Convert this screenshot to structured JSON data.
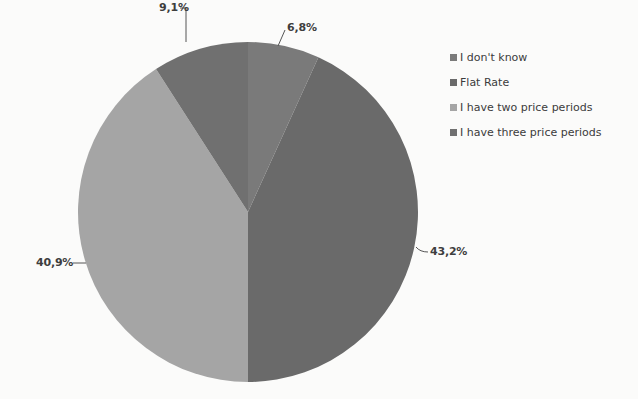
{
  "chart_data": {
    "type": "pie",
    "title": "",
    "categories": [
      "I don't know",
      "Flat Rate",
      "I have two price periods",
      "I have three price periods"
    ],
    "values": [
      6.8,
      43.2,
      40.9,
      9.1
    ],
    "value_labels": [
      "6,8%",
      "43,2%",
      "40,9%",
      "9,1%"
    ],
    "colors": [
      "#7a7a7a",
      "#6a6a6a",
      "#a5a5a5",
      "#707070"
    ],
    "start_angle": "12 o'clock",
    "direction": "clockwise",
    "legend_position": "right"
  },
  "legend": {
    "items": [
      {
        "label": "I don't know",
        "color": "#7a7a7a"
      },
      {
        "label": "Flat Rate",
        "color": "#6a6a6a"
      },
      {
        "label": "I have two price periods",
        "color": "#a5a5a5"
      },
      {
        "label": "I have three price periods",
        "color": "#707070"
      }
    ]
  },
  "labels": {
    "dont_know": "6,8%",
    "flat_rate": "43,2%",
    "two_periods": "40,9%",
    "three_periods": "9,1%"
  }
}
